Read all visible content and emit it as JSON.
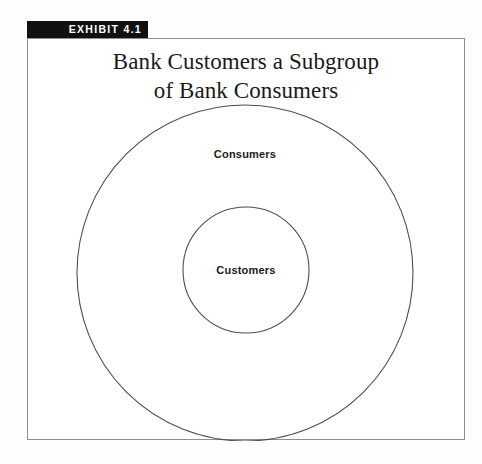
{
  "exhibit": {
    "tag_label": "EXHIBIT 4.1",
    "tag_bg_color": "#111111",
    "tag_text_color": "#ffffff",
    "title_lines": [
      "Bank Customers a Subgroup",
      "of Bank Consumers"
    ],
    "frame_border_color": "#8e8e8e",
    "background_color": "#ffffff"
  },
  "diagram": {
    "type": "venn-subset",
    "stroke_color": "#4d4d4d",
    "outer": {
      "label": "Consumers",
      "cx": 217,
      "cy": 234,
      "r": 168
    },
    "inner": {
      "label": "Customers",
      "cx": 218,
      "cy": 231,
      "r": 63
    }
  }
}
